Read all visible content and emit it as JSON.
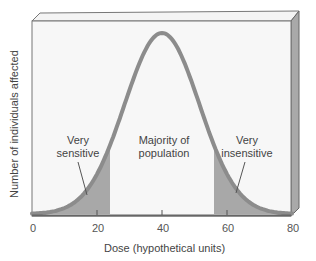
{
  "chart_data": {
    "type": "area",
    "title": "",
    "xlabel": "Dose (hypothetical units)",
    "ylabel": "Number of individuals affected",
    "x_ticks": [
      "0",
      "20",
      "40",
      "60",
      "80"
    ],
    "xlim": [
      0,
      80
    ],
    "distribution": "normal (bell curve)",
    "mean": 40,
    "regions": [
      {
        "name": "Very sensitive",
        "x_range": [
          0,
          24
        ],
        "shaded": true
      },
      {
        "name": "Majority of population",
        "x_range": [
          24,
          56
        ],
        "shaded": false
      },
      {
        "name": "Very insensitive",
        "x_range": [
          56,
          80
        ],
        "shaded": true
      }
    ],
    "grid": false,
    "legend": "none",
    "colors": {
      "curve": "#8a8a8a",
      "shade": "#a6a6a6",
      "box_side": "#a9a9a9",
      "background": "#f6f6f6"
    }
  },
  "labels": {
    "very_sensitive": [
      "Very",
      "sensitive"
    ],
    "majority": [
      "Majority of",
      "population"
    ],
    "very_insensitive": [
      "Very",
      "insensitive"
    ]
  }
}
